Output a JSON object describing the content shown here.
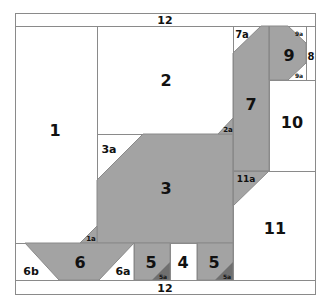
{
  "colors": {
    "fill": "#a3a3a3",
    "dark_fill": "#6f6f6f",
    "line": "#8a8a8a",
    "background": "#ffffff"
  },
  "labels": {
    "top_strip": "12",
    "bottom_strip": "12",
    "p1": "1",
    "p1a": "1a",
    "p2": "2",
    "p2a": "2a",
    "p3": "3",
    "p3a": "3a",
    "p4": "4",
    "p5_left": "5",
    "p5a_left": "5a",
    "p5_right": "5",
    "p5a_right": "5a",
    "p6": "6",
    "p6a": "6a",
    "p6b": "6b",
    "p7": "7",
    "p7a": "7a",
    "p8": "8",
    "p9": "9",
    "p9a_top": "9a",
    "p9a_bottom": "9a",
    "p10": "10",
    "p11": "11",
    "p11a": "11a"
  }
}
